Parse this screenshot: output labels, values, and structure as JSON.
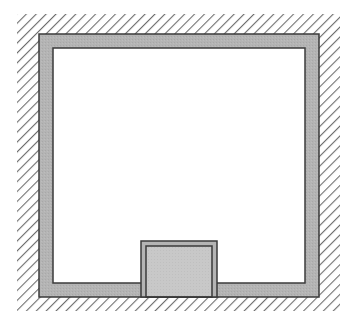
{
  "diagram": {
    "type": "floor-plan-section",
    "colors": {
      "background": "#ffffff",
      "hatch": "#6e6e6e",
      "wall_fill": "#b4b4b4",
      "wall_stroke": "#3a3a3a",
      "interior": "#ffffff",
      "box_fill": "#c8c8c8"
    },
    "elements": [
      {
        "name": "hatched-ground",
        "x": 17,
        "y": 14,
        "w": 323,
        "h": 297
      },
      {
        "name": "outer-wall",
        "x": 39,
        "y": 34,
        "w": 280,
        "h": 263
      },
      {
        "name": "interior-space",
        "x": 53,
        "y": 48,
        "w": 252,
        "h": 235
      },
      {
        "name": "bottom-box",
        "x": 141,
        "y": 241,
        "w": 76,
        "h": 56
      }
    ]
  }
}
